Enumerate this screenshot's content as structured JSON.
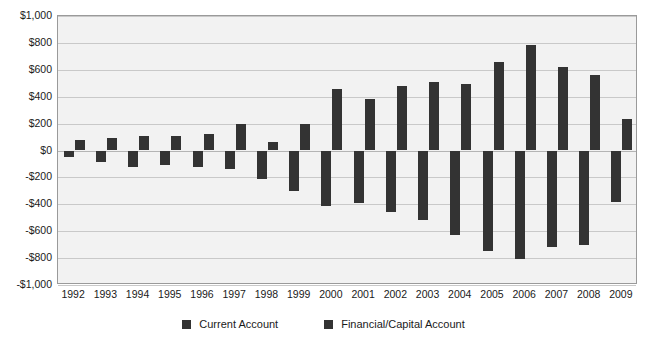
{
  "chart_data": {
    "type": "bar",
    "title": "",
    "xlabel": "",
    "ylabel": "",
    "ylim": [
      -1000,
      1000
    ],
    "ytick_step": 200,
    "grid": true,
    "legend_position": "bottom",
    "value_unit": "billions of US dollars",
    "categories": [
      "1992",
      "1993",
      "1994",
      "1995",
      "1996",
      "1997",
      "1998",
      "1999",
      "2000",
      "2001",
      "2002",
      "2003",
      "2004",
      "2005",
      "2006",
      "2007",
      "2008",
      "2009"
    ],
    "ytick_labels": [
      "$1,000",
      "$800",
      "$600",
      "$400",
      "$200",
      "$0",
      "-$200",
      "-$400",
      "-$600",
      "-$800",
      "-$1,000"
    ],
    "ytick_values": [
      1000,
      800,
      600,
      400,
      200,
      0,
      -200,
      -400,
      -600,
      -800,
      -1000
    ],
    "series": [
      {
        "name": "Current Account",
        "color": "#333333",
        "values": [
          -50,
          -85,
          -120,
          -110,
          -125,
          -140,
          -215,
          -300,
          -415,
          -390,
          -460,
          -520,
          -630,
          -745,
          -805,
          -715,
          -700,
          -380
        ]
      },
      {
        "name": "Financial/Capital Account",
        "color": "#333333",
        "values": [
          75,
          95,
          110,
          110,
          120,
          195,
          60,
          200,
          455,
          385,
          480,
          510,
          495,
          660,
          785,
          620,
          560,
          235
        ]
      }
    ]
  },
  "legend": {
    "items": [
      {
        "label": "Current Account",
        "color": "#333333"
      },
      {
        "label": "Financial/Capital Account",
        "color": "#333333"
      }
    ]
  }
}
